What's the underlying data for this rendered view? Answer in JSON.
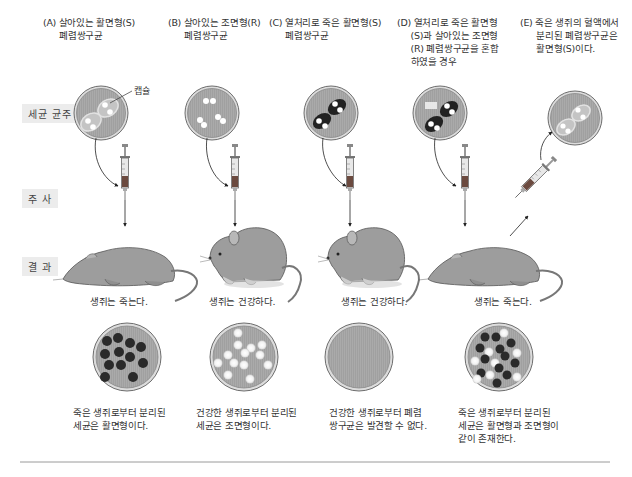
{
  "row_labels": {
    "colony": "세균 균주",
    "injection": "주 사",
    "result": "결 과"
  },
  "capsule_label": "캡슐",
  "columns": [
    {
      "id": "A",
      "header": "(A) 살아있는 활면형(S)\n      폐렴쌍구균",
      "colony": "live-S",
      "mouse_state": "dead",
      "result_text": "생쥐는 죽는다.",
      "plate": "S-colonies",
      "conclusion": "죽은 생쥐로부터 분리된\n세균은 활면형이다."
    },
    {
      "id": "B",
      "header": "(B) 살아있는 조면형(R)\n      폐렴쌍구균",
      "colony": "live-R",
      "mouse_state": "healthy",
      "result_text": "생쥐는 건강하다.",
      "plate": "R-colonies",
      "conclusion": "건강한 생쥐로부터 분리된\n세균은 조면형이다."
    },
    {
      "id": "C",
      "header": "(C) 열처리로 죽은 활면형(S)\n      폐렴쌍구균",
      "colony": "heat-killed-S",
      "mouse_state": "healthy",
      "result_text": "생쥐는 건강하다.",
      "plate": "empty",
      "conclusion": "건강한 생쥐로부터 폐렴\n쌍구균은 발견할 수 없다."
    },
    {
      "id": "D",
      "header": "(D) 열처리로 죽은 활면형\n     (S)과 살아있는 조면형\n     (R) 폐렴쌍구균을 혼합\n     하였을 경우",
      "colony": "heat-killed-S-plus-live-R",
      "mouse_state": "dead",
      "result_text": "생쥐는 죽는다.",
      "plate": "mixed-colonies",
      "conclusion": "죽은 생쥐로부터 분리된\n세균은 활면형과 조면형이\n같이 존재한다."
    },
    {
      "id": "E",
      "header": "(E) 죽은 생쥐의 혈액에서\n      분리된 폐렴쌍구균은\n      활면형(S)이다.",
      "colony": "recovered-live-S"
    }
  ],
  "colors": {
    "plate_fill": "#a9a9a9",
    "plate_rim": "#7a7a7a",
    "dark_colony": "#2a2a2a",
    "light_colony": "#f4f4f4",
    "mouse": "#9d9d9d",
    "rule": "#9a9a9a"
  }
}
